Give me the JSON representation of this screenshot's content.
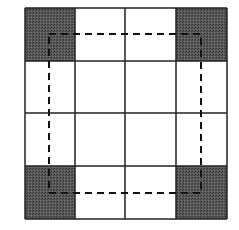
{
  "diagram": {
    "grid": {
      "rows": 4,
      "cols": 4,
      "x_lines": [
        25,
        75,
        125,
        176,
        227
      ],
      "y_lines": [
        8,
        61,
        113,
        166,
        219
      ],
      "line_color": "#222222"
    },
    "shaded_cells": [
      {
        "row": 0,
        "col": 0
      },
      {
        "row": 0,
        "col": 3
      },
      {
        "row": 3,
        "col": 0
      },
      {
        "row": 3,
        "col": 3
      }
    ],
    "shade_color": "#4a4a4a",
    "dashed_rect": {
      "x1": 49,
      "y1": 34,
      "x2": 201,
      "y2": 193,
      "color": "#111111"
    }
  }
}
